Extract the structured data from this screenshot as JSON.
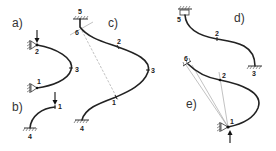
{
  "figure": {
    "panels": [
      {
        "id": "a",
        "label": "a)",
        "nodes": [
          {
            "id": "2",
            "label": "2",
            "support": "pinned",
            "load": "arrow-down"
          },
          {
            "id": "3",
            "label": "3"
          },
          {
            "id": "1",
            "label": "1",
            "support": "pinned"
          }
        ]
      },
      {
        "id": "b",
        "label": "b)",
        "nodes": [
          {
            "id": "1",
            "label": "1",
            "load": "arrow-down"
          },
          {
            "id": "4",
            "label": "4",
            "support": "fixed"
          }
        ]
      },
      {
        "id": "c",
        "label": "c)",
        "nodes": [
          {
            "id": "5",
            "label": "5",
            "support": "fixed"
          },
          {
            "id": "6",
            "label": "6"
          },
          {
            "id": "2",
            "label": "2"
          },
          {
            "id": "3",
            "label": "3"
          },
          {
            "id": "1",
            "label": "1"
          },
          {
            "id": "4",
            "label": "4",
            "support": "fixed"
          }
        ],
        "guide_lines": [
          {
            "from": "6",
            "to": "1",
            "style": "dashed"
          }
        ]
      },
      {
        "id": "d",
        "label": "d)",
        "nodes": [
          {
            "id": "5",
            "label": "5",
            "support": "fixed"
          },
          {
            "id": "2",
            "label": "2"
          },
          {
            "id": "3",
            "label": "3",
            "support": "fixed"
          }
        ]
      },
      {
        "id": "e",
        "label": "e)",
        "nodes": [
          {
            "id": "6",
            "label": "6"
          },
          {
            "id": "2",
            "label": "2"
          },
          {
            "id": "1",
            "label": "1",
            "support": "pinned",
            "load": "arrow-up"
          }
        ],
        "guide_lines": [
          {
            "from": "6",
            "to": "1",
            "style": "thin"
          },
          {
            "from": "2",
            "to": "1",
            "style": "thin"
          }
        ]
      }
    ]
  },
  "labels": {
    "a": "a)",
    "b": "b)",
    "c": "c)",
    "d": "d)",
    "e": "e)",
    "a_n2": "2",
    "a_n3": "3",
    "a_n1": "1",
    "b_n1": "1",
    "b_n4": "4",
    "c_n5": "5",
    "c_n6": "6",
    "c_n2": "2",
    "c_n3": "3",
    "c_n1": "1",
    "c_n4": "4",
    "d_n5": "5",
    "d_n2": "2",
    "d_n3": "3",
    "e_n6": "6",
    "e_n2": "2",
    "e_n1": "1"
  },
  "colors": {
    "curve": "#222222",
    "guide": "#999999",
    "background": "#ffffff"
  }
}
